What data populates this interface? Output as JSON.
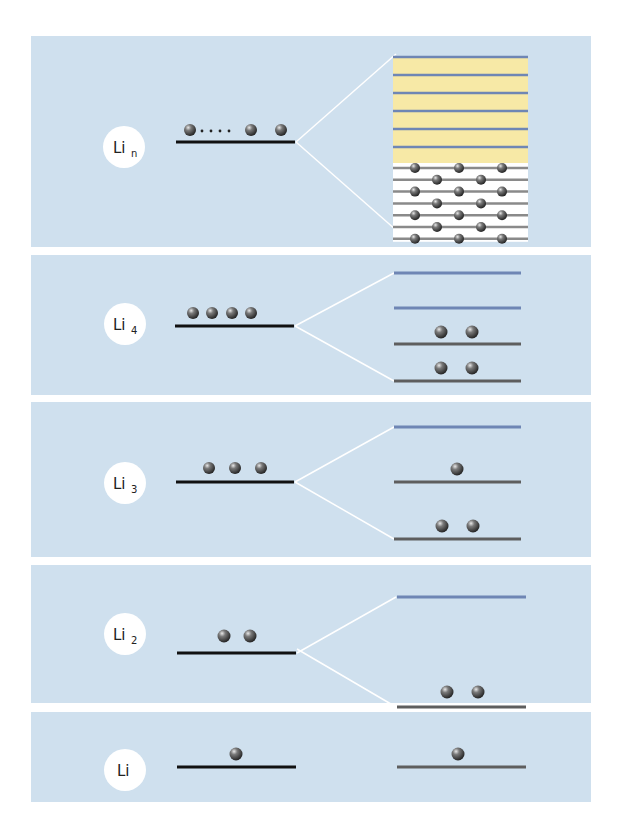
{
  "colors": {
    "panel_bg": "#cfe0ee",
    "page_bg": "#ffffff",
    "label_circle": "#ffffff",
    "atomic_level": "#111111",
    "bonding_level": "#5e5e5e",
    "antibonding_level": "#6f86b4",
    "connector": "#ffffff",
    "band_fill_empty": "#f7e9a6",
    "band_fill_filled": "#ffffff",
    "sphere": "#4a4a4a"
  },
  "panels": [
    {
      "id": "lin",
      "label_main": "Li",
      "label_sub": "n",
      "atom_electrons": "many (dotted)",
      "left_level_electrons": 4,
      "right": {
        "type": "band",
        "empty_band_lines": 6,
        "filled_band_rows": [
          3,
          2,
          3,
          2,
          3,
          2,
          3
        ]
      }
    },
    {
      "id": "li4",
      "label_main": "Li",
      "label_sub": "4",
      "left_level_electrons": 4,
      "right": {
        "type": "levels",
        "levels": [
          {
            "kind": "antibonding",
            "electrons": 0
          },
          {
            "kind": "antibonding",
            "electrons": 0
          },
          {
            "kind": "bonding",
            "electrons": 2
          },
          {
            "kind": "bonding",
            "electrons": 2
          }
        ]
      }
    },
    {
      "id": "li3",
      "label_main": "Li",
      "label_sub": "3",
      "left_level_electrons": 3,
      "right": {
        "type": "levels",
        "levels": [
          {
            "kind": "antibonding",
            "electrons": 0
          },
          {
            "kind": "nonbonding",
            "electrons": 1
          },
          {
            "kind": "bonding",
            "electrons": 2
          }
        ]
      }
    },
    {
      "id": "li2",
      "label_main": "Li",
      "label_sub": "2",
      "left_level_electrons": 2,
      "right": {
        "type": "levels",
        "levels": [
          {
            "kind": "antibonding",
            "electrons": 0
          },
          {
            "kind": "bonding",
            "electrons": 2
          }
        ]
      }
    },
    {
      "id": "li",
      "label_main": "Li",
      "label_sub": "",
      "left_level_electrons": 1,
      "right": {
        "type": "levels",
        "levels": [
          {
            "kind": "bonding",
            "electrons": 1
          }
        ]
      }
    }
  ]
}
